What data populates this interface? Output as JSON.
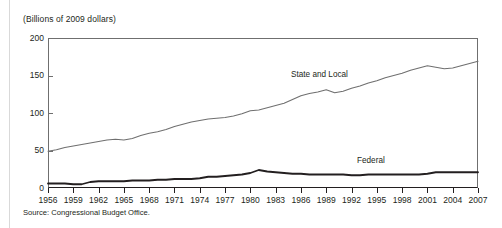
{
  "figure": {
    "axis_title": "(Billions of 2009 dollars)",
    "source_note": "Source: Congressional Budget Office.",
    "label_state_local": "State and Local",
    "label_federal": "Federal"
  },
  "chart_data": {
    "type": "line",
    "title": "",
    "subtitle": "",
    "xlabel": "",
    "ylabel": "(Billions of 2009 dollars)",
    "ylim": [
      0,
      200
    ],
    "xlim": [
      1956,
      2007
    ],
    "yticks": [
      0,
      50,
      100,
      150,
      200
    ],
    "ytick_labels": [
      "0",
      "50",
      "100",
      "150",
      "200"
    ],
    "xticks": [
      1956,
      1959,
      1962,
      1965,
      1968,
      1971,
      1974,
      1977,
      1980,
      1983,
      1986,
      1989,
      1992,
      1995,
      1998,
      2001,
      2004,
      2007
    ],
    "xtick_labels": [
      "1956",
      "1959",
      "1962",
      "1965",
      "1968",
      "1971",
      "1974",
      "1977",
      "1980",
      "1983",
      "1986",
      "1989",
      "1992",
      "1995",
      "1998",
      "2001",
      "2004",
      "2007"
    ],
    "grid": false,
    "legend_position": "inline-annotation",
    "annotations": [
      {
        "text": "State and Local",
        "x": 1989,
        "y": 140
      },
      {
        "text": "Federal",
        "x": 1995,
        "y": 32
      }
    ],
    "x": [
      1956,
      1957,
      1958,
      1959,
      1960,
      1961,
      1962,
      1963,
      1964,
      1965,
      1966,
      1967,
      1968,
      1969,
      1970,
      1971,
      1972,
      1973,
      1974,
      1975,
      1976,
      1977,
      1978,
      1979,
      1980,
      1981,
      1982,
      1983,
      1984,
      1985,
      1986,
      1987,
      1988,
      1989,
      1990,
      1991,
      1992,
      1993,
      1994,
      1995,
      1996,
      1997,
      1998,
      1999,
      2000,
      2001,
      2002,
      2003,
      2004,
      2005,
      2006,
      2007
    ],
    "series": [
      {
        "name": "State and Local",
        "color": "#6f6f6f",
        "values": [
          49,
          51,
          54,
          56,
          58,
          60,
          62,
          64,
          65,
          64,
          66,
          70,
          73,
          75,
          78,
          82,
          85,
          88,
          90,
          92,
          93,
          94,
          96,
          99,
          103,
          104,
          107,
          110,
          113,
          118,
          123,
          126,
          128,
          131,
          127,
          129,
          133,
          136,
          140,
          143,
          147,
          150,
          153,
          157,
          160,
          163,
          161,
          159,
          160,
          163,
          166,
          169
        ]
      },
      {
        "name": "Federal",
        "color": "#231f20",
        "values": [
          6,
          6,
          6,
          5,
          5,
          8,
          9,
          9,
          9,
          9,
          10,
          10,
          10,
          11,
          11,
          12,
          12,
          12,
          13,
          15,
          15,
          16,
          17,
          18,
          20,
          24,
          22,
          21,
          20,
          19,
          19,
          18,
          18,
          18,
          18,
          18,
          17,
          17,
          18,
          18,
          18,
          18,
          18,
          18,
          18,
          19,
          21,
          21,
          21,
          21,
          21,
          21
        ]
      }
    ]
  }
}
